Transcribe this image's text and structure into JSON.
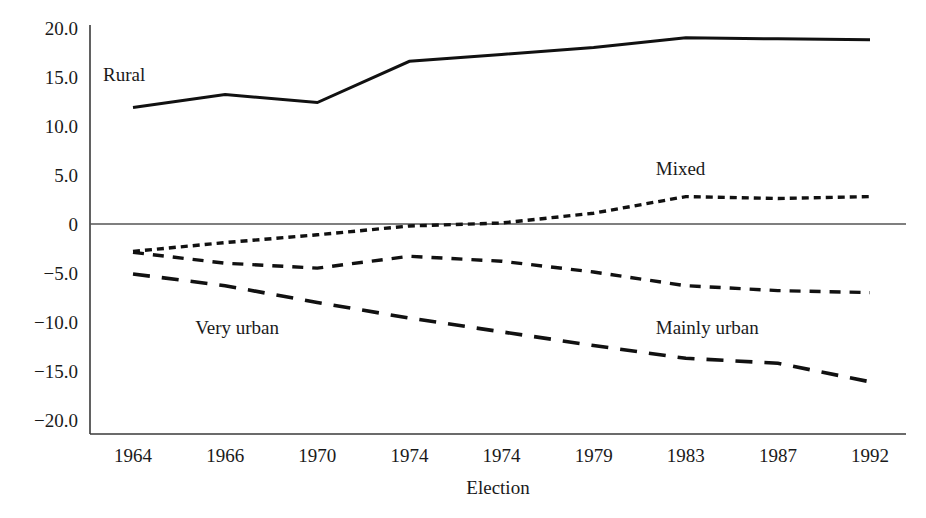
{
  "chart_data": {
    "type": "line",
    "title": "",
    "xlabel": "Election",
    "ylabel": "",
    "categories": [
      "1964",
      "1966",
      "1970",
      "1974",
      "1974",
      "1979",
      "1983",
      "1987",
      "1992"
    ],
    "ylim": [
      -20.0,
      20.0
    ],
    "yticks": [
      "20.0",
      "15.0",
      "10.0",
      "5.0",
      "0",
      "-5.0",
      "-10.0",
      "-15.0",
      "-20.0"
    ],
    "ytick_values": [
      20.0,
      15.0,
      10.0,
      5.0,
      0,
      -5.0,
      -10.0,
      -15.0,
      -20.0
    ],
    "grid": false,
    "zero_line": true,
    "legend_position": "inline-annotations",
    "series": [
      {
        "name": "Rural",
        "style": "solid",
        "values": [
          11.9,
          13.2,
          12.4,
          16.6,
          17.3,
          18.0,
          19.0,
          18.9,
          18.8
        ],
        "label": "Rural",
        "label_x": 1964,
        "label_y": 14.6
      },
      {
        "name": "Mixed",
        "style": "fine-dotted",
        "values": [
          -2.8,
          -1.9,
          -1.1,
          -0.2,
          0.1,
          1.1,
          2.8,
          2.6,
          2.8
        ],
        "label": "Mixed",
        "label_x": 1983,
        "label_y": 5.0
      },
      {
        "name": "Mainly urban",
        "style": "short-dashed",
        "values": [
          -2.9,
          -4.0,
          -4.5,
          -3.3,
          -3.8,
          -4.9,
          -6.3,
          -6.8,
          -7.0
        ],
        "label": "Mainly urban",
        "label_x": 1983,
        "label_y": -11.2
      },
      {
        "name": "Very urban",
        "style": "long-dashed",
        "values": [
          -5.1,
          -6.3,
          -8.0,
          -9.6,
          -11.0,
          -12.4,
          -13.7,
          -14.2,
          -16.1
        ],
        "label": "Very urban",
        "label_x": 1966,
        "label_y": -11.2
      }
    ],
    "colors": {
      "line": "#111111",
      "axis": "#3a3a3a",
      "zero": "#555555",
      "text": "#1a1a1a",
      "background": "#ffffff"
    }
  }
}
